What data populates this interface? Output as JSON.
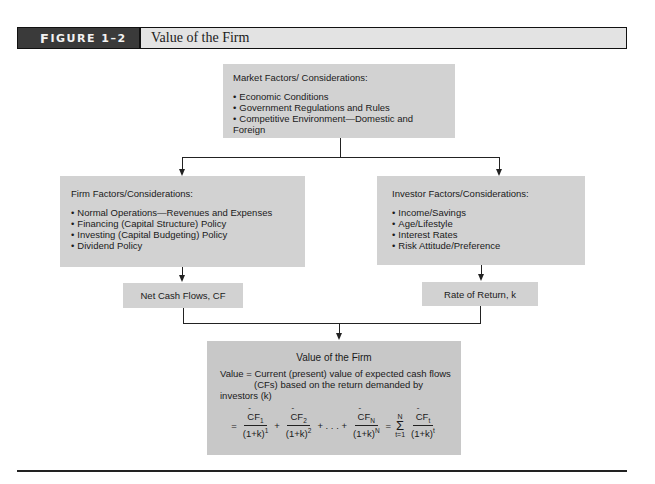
{
  "figure": {
    "label_prefix": "F",
    "label_rest": "IGURE 1–2",
    "title": "Value of the Firm"
  },
  "market_box": {
    "title": "Market Factors/ Considerations:",
    "items": [
      "Economic Conditions",
      "Government Regulations and Rules",
      "Competitive Environment—Domestic and Foreign"
    ]
  },
  "firm_box": {
    "title": "Firm Factors/Considerations:",
    "items": [
      "Normal Operations—Revenues and Expenses",
      "Financing (Capital Structure) Policy",
      "Investing (Capital Budgeting) Policy",
      "Dividend Policy"
    ]
  },
  "investor_box": {
    "title": "Investor Factors/Considerations:",
    "items": [
      "Income/Savings",
      "Age/Lifestyle",
      "Interest Rates",
      "Risk Attitude/Preference"
    ]
  },
  "cash_flows_box": {
    "label": "Net Cash Flows, CF"
  },
  "rate_box": {
    "label": "Rate of Return, k"
  },
  "value_box": {
    "title": "Value of the Firm",
    "line1_prefix": "Value = ",
    "line1": "Current (present) value of expected cash flows",
    "line2": "(CFs) based on the return demanded by investors (k)",
    "formula": {
      "eq": "=",
      "t1_num": "CF",
      "t1_sub": "1",
      "t1_den": "(1+k)",
      "t1_exp": "1",
      "plus1": "+",
      "t2_num": "CF",
      "t2_sub": "2",
      "t2_den": "(1+k)",
      "t2_exp": "2",
      "ellipsis": "+ . . . +",
      "tn_num": "CF",
      "tn_sub": "N",
      "tn_den": "(1+k)",
      "tn_exp": "N",
      "eq2": "=",
      "sigma_top": "N",
      "sigma": "Σ",
      "sigma_bottom": "t=1",
      "ts_num": "CF",
      "ts_sub": "t",
      "ts_den": "(1+k)",
      "ts_exp": "t"
    }
  }
}
